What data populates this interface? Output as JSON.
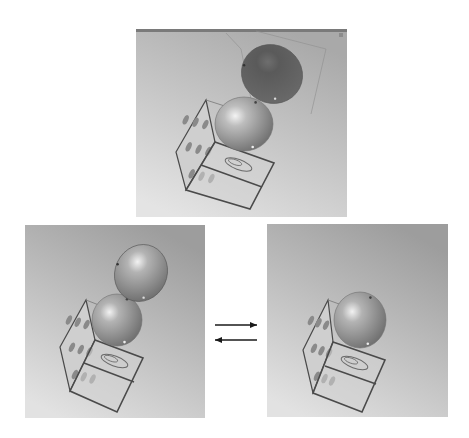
{
  "figure": {
    "description": "CAD assembly views: perforated cube frame with hemisphere cap; exploded and assembled states",
    "background": "#ffffff"
  },
  "panels": [
    {
      "id": "top",
      "label": "Viewport with dark hemisphere shell above cube",
      "x": 136,
      "y": 29,
      "w": 211,
      "h": 188,
      "bg_top": "#a9a9a9",
      "bg_bottom": "#e4e4e4",
      "has_titlebar_strip": true,
      "floating_hemisphere": {
        "cx": 272,
        "cy": 74,
        "rx": 31,
        "ry": 29,
        "rotate": 28,
        "fill": "#5a5a5a",
        "highlight": "#6e6e6e"
      },
      "seated_hemisphere": {
        "cx": 244,
        "cy": 124,
        "rx": 29,
        "ry": 27,
        "fill": "#bdbdbd",
        "highlight": "#f3f3f3"
      },
      "cube": {
        "front": [
          [
            215,
            142
          ],
          [
            274,
            163
          ],
          [
            250,
            209
          ],
          [
            186,
            190
          ]
        ],
        "mid": [
          [
            201,
            165
          ],
          [
            262,
            187
          ]
        ],
        "left": [
          [
            176,
            152
          ],
          [
            206,
            100
          ],
          [
            215,
            142
          ],
          [
            186,
            190
          ]
        ],
        "top_back": [
          [
            206,
            100
          ],
          [
            262,
            118
          ]
        ]
      }
    },
    {
      "id": "bottom-left",
      "label": "Exploded view: hemisphere floating above seated hemisphere",
      "x": 25,
      "y": 225,
      "w": 180,
      "h": 193,
      "bg_top": "#9d9d9d",
      "bg_bottom": "#e2e2e2",
      "has_titlebar_strip": false,
      "floating_hemisphere": {
        "cx": 141,
        "cy": 273,
        "rx": 26,
        "ry": 29,
        "rotate": 25,
        "fill": "#b3b3b3",
        "highlight": "#f2f2f2"
      },
      "seated_hemisphere": {
        "cx": 117,
        "cy": 320,
        "rx": 25,
        "ry": 26,
        "fill": "#b3b3b3",
        "highlight": "#f2f2f2"
      },
      "cube": {
        "front": [
          [
            95,
            340
          ],
          [
            143,
            358
          ],
          [
            117,
            412
          ],
          [
            70,
            391
          ]
        ],
        "mid": [
          [
            84,
            363
          ],
          [
            134,
            382
          ]
        ],
        "left": [
          [
            60,
            347
          ],
          [
            86,
            300
          ],
          [
            95,
            340
          ],
          [
            70,
            391
          ]
        ],
        "top_back": [
          [
            86,
            300
          ],
          [
            132,
            318
          ]
        ]
      }
    },
    {
      "id": "bottom-right",
      "label": "Assembled view: single hemisphere seated on cube",
      "x": 267,
      "y": 224,
      "w": 181,
      "h": 193,
      "bg_top": "#9d9d9d",
      "bg_bottom": "#e2e2e2",
      "has_titlebar_strip": false,
      "floating_hemisphere": null,
      "seated_hemisphere": {
        "cx": 360,
        "cy": 320,
        "rx": 26,
        "ry": 28,
        "fill": "#b3b3b3",
        "highlight": "#f2f2f2"
      },
      "cube": {
        "front": [
          [
            333,
            342
          ],
          [
            385,
            360
          ],
          [
            362,
            412
          ],
          [
            313,
            393
          ]
        ],
        "mid": [
          [
            325,
            366
          ],
          [
            376,
            384
          ]
        ],
        "left": [
          [
            303,
            350
          ],
          [
            328,
            300
          ],
          [
            333,
            342
          ],
          [
            313,
            393
          ]
        ],
        "top_back": [
          [
            328,
            300
          ],
          [
            378,
            318
          ]
        ]
      }
    }
  ],
  "arrows": {
    "x": 205,
    "y": 310,
    "w": 62,
    "h": 40,
    "items": [
      {
        "direction": "right",
        "x1": 10,
        "y1": 15,
        "x2": 52,
        "y2": 15,
        "label": "to assembled"
      },
      {
        "direction": "left",
        "x1": 52,
        "y1": 30,
        "x2": 10,
        "y2": 30,
        "label": "to exploded"
      }
    ],
    "color": "#1a1a1a"
  },
  "colors": {
    "cube_edge": "#4a4a4a",
    "cube_face": "#cfcfcf",
    "hole": "#8a8a8a"
  }
}
